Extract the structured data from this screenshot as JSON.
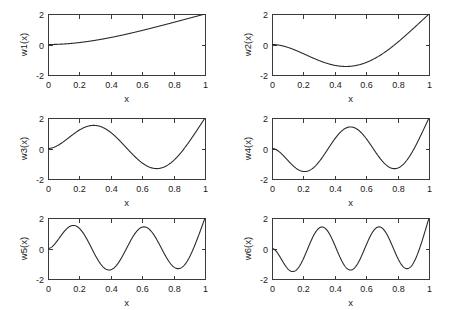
{
  "figure": {
    "background": "#ffffff",
    "axis_color": "#3a3a3a",
    "curve_color": "#2b2b2b",
    "rows": 3,
    "cols": 2
  },
  "chart_data": [
    {
      "type": "line",
      "name": "w1",
      "title": "",
      "xlabel": "x",
      "ylabel": "w1(x)",
      "xlim": [
        0,
        1
      ],
      "ylim": [
        -2,
        2
      ],
      "xticks": [
        0,
        0.2,
        0.4,
        0.6,
        0.8,
        1
      ],
      "xticklabels": [
        "0",
        "0.2",
        "0.4",
        "0.6",
        "0.8",
        "1"
      ],
      "yticks": [
        -2,
        0,
        2
      ],
      "yticklabels": [
        "-2",
        "0",
        "2"
      ],
      "grid": false,
      "legend": "none",
      "x": [
        0,
        0.05,
        0.1,
        0.15,
        0.2,
        0.25,
        0.3,
        0.35,
        0.4,
        0.45,
        0.5,
        0.55,
        0.6,
        0.65,
        0.7,
        0.75,
        0.8,
        0.85,
        0.9,
        0.95,
        1
      ],
      "y": [
        0.0,
        0.012,
        0.048,
        0.106,
        0.185,
        0.283,
        0.398,
        0.528,
        0.671,
        0.825,
        0.988,
        1.158,
        1.333,
        1.511,
        1.69,
        1.868,
        2.044,
        2.215,
        2.38,
        2.538,
        2.0
      ]
    },
    {
      "type": "line",
      "name": "w2",
      "title": "",
      "xlabel": "x",
      "ylabel": "w2(x)",
      "xlim": [
        0,
        1
      ],
      "ylim": [
        -2,
        2
      ],
      "xticks": [
        0,
        0.2,
        0.4,
        0.6,
        0.8,
        1
      ],
      "xticklabels": [
        "0",
        "0.2",
        "0.4",
        "0.6",
        "0.8",
        "1"
      ],
      "yticks": [
        -2,
        0,
        2
      ],
      "yticklabels": [
        "-2",
        "0",
        "2"
      ],
      "grid": false,
      "legend": "none",
      "peak_x": 0.47,
      "peak_y": 1.48,
      "end_y": -2.0
    },
    {
      "type": "line",
      "name": "w3",
      "title": "",
      "xlabel": "x",
      "ylabel": "w3(x)",
      "xlim": [
        0,
        1
      ],
      "ylim": [
        -2,
        2
      ],
      "xticks": [
        0,
        0.2,
        0.4,
        0.6,
        0.8,
        1
      ],
      "xticklabels": [
        "0",
        "0.2",
        "0.4",
        "0.6",
        "0.8",
        "1"
      ],
      "yticks": [
        -2,
        0,
        2
      ],
      "yticklabels": [
        "-2",
        "0",
        "2"
      ],
      "grid": false,
      "legend": "none",
      "peak_x": 0.29,
      "peak_y": 1.6,
      "trough_x": 0.69,
      "trough_y": -1.42,
      "end_y": 2.0
    },
    {
      "type": "line",
      "name": "w4",
      "title": "",
      "xlabel": "x",
      "ylabel": "w4(x)",
      "xlim": [
        0,
        1
      ],
      "ylim": [
        -2,
        2
      ],
      "xticks": [
        0,
        0.2,
        0.4,
        0.6,
        0.8,
        1
      ],
      "xticklabels": [
        "0",
        "0.2",
        "0.4",
        "0.6",
        "0.8",
        "1"
      ],
      "yticks": [
        -2,
        0,
        2
      ],
      "yticklabels": [
        "-2",
        "0",
        "2"
      ],
      "grid": false,
      "legend": "none",
      "peaks_x": [
        0.21,
        0.78
      ],
      "peaks_y": [
        1.52,
        1.36
      ],
      "trough_x": 0.5,
      "trough_y": -1.42,
      "end_y": -2.0
    },
    {
      "type": "line",
      "name": "w5",
      "title": "",
      "xlabel": "x",
      "ylabel": "w5(x)",
      "xlim": [
        0,
        1
      ],
      "ylim": [
        -2,
        2
      ],
      "xticks": [
        0,
        0.2,
        0.4,
        0.6,
        0.8,
        1
      ],
      "xticklabels": [
        "0",
        "0.2",
        "0.4",
        "0.6",
        "0.8",
        "1"
      ],
      "yticks": [
        -2,
        0,
        2
      ],
      "yticklabels": [
        "-2",
        "0",
        "2"
      ],
      "grid": false,
      "legend": "none",
      "peaks_x": [
        0.16,
        0.61
      ],
      "peaks_y": [
        1.55,
        1.46
      ],
      "troughs_x": [
        0.39,
        0.83
      ],
      "troughs_y": [
        -1.44,
        -1.4
      ],
      "end_y": 2.0
    },
    {
      "type": "line",
      "name": "w6",
      "title": "",
      "xlabel": "x",
      "ylabel": "w6(x)",
      "xlim": [
        0,
        1
      ],
      "ylim": [
        -2,
        2
      ],
      "xticks": [
        0,
        0.2,
        0.4,
        0.6,
        0.8,
        1
      ],
      "xticklabels": [
        "0",
        "0.2",
        "0.4",
        "0.6",
        "0.8",
        "1"
      ],
      "yticks": [
        -2,
        0,
        2
      ],
      "yticklabels": [
        "-2",
        "0",
        "2"
      ],
      "grid": false,
      "legend": "none",
      "peaks_x": [
        0.13,
        0.5,
        0.86
      ],
      "peaks_y": [
        1.53,
        1.47,
        1.38
      ],
      "troughs_x": [
        0.31,
        0.68
      ],
      "troughs_y": [
        -1.45,
        -1.44
      ],
      "end_y": -2.0
    }
  ],
  "panels": [
    {
      "id": "p1",
      "ylabel": "w1(x)",
      "xlabel": "x",
      "mode": 1,
      "xticklabels": [
        "0",
        "0.2",
        "0.4",
        "0.6",
        "0.8",
        "1"
      ],
      "yticklabels": [
        "2",
        "0",
        "-2"
      ]
    },
    {
      "id": "p2",
      "ylabel": "w2(x)",
      "xlabel": "x",
      "mode": 2,
      "xticklabels": [
        "0",
        "0.2",
        "0.4",
        "0.6",
        "0.8",
        "1"
      ],
      "yticklabels": [
        "2",
        "0",
        "-2"
      ]
    },
    {
      "id": "p3",
      "ylabel": "w3(x)",
      "xlabel": "x",
      "mode": 3,
      "xticklabels": [
        "0",
        "0.2",
        "0.4",
        "0.6",
        "0.8",
        "1"
      ],
      "yticklabels": [
        "2",
        "0",
        "-2"
      ]
    },
    {
      "id": "p4",
      "ylabel": "w4(x)",
      "xlabel": "x",
      "mode": 4,
      "xticklabels": [
        "0",
        "0.2",
        "0.4",
        "0.6",
        "0.8",
        "1"
      ],
      "yticklabels": [
        "2",
        "0",
        "-2"
      ]
    },
    {
      "id": "p5",
      "ylabel": "w5(x)",
      "xlabel": "x",
      "mode": 5,
      "xticklabels": [
        "0",
        "0.2",
        "0.4",
        "0.6",
        "0.8",
        "1"
      ],
      "yticklabels": [
        "2",
        "0",
        "-2"
      ]
    },
    {
      "id": "p6",
      "ylabel": "w6(x)",
      "xlabel": "x",
      "mode": 6,
      "xticklabels": [
        "0",
        "0.2",
        "0.4",
        "0.6",
        "0.8",
        "1"
      ],
      "yticklabels": [
        "2",
        "0",
        "-2"
      ]
    }
  ]
}
